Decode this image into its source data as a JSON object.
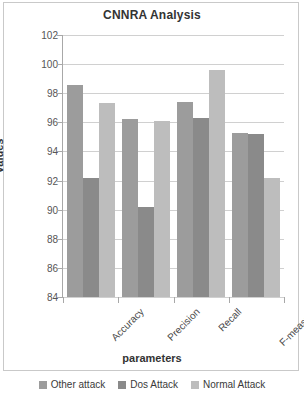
{
  "chart_data": {
    "type": "bar",
    "title": "CNNRA Analysis",
    "xlabel": "parameters",
    "ylabel": "Values",
    "categories": [
      "Accuracy",
      "Precision",
      "Recall",
      "F-measure"
    ],
    "series": [
      {
        "name": "Other attack",
        "color": "#9c9c9c",
        "values": [
          98.6,
          96.2,
          97.4,
          95.3
        ]
      },
      {
        "name": "Dos Attack",
        "color": "#8a8a8a",
        "values": [
          92.2,
          90.2,
          96.3,
          95.2
        ]
      },
      {
        "name": "Normal Attack",
        "color": "#bdbdbd",
        "values": [
          97.3,
          96.1,
          99.6,
          92.2
        ]
      }
    ],
    "ylim": [
      84,
      102
    ],
    "ytick_step": 2,
    "yticks": [
      102,
      100,
      98,
      96,
      94,
      92,
      90,
      88,
      86,
      84
    ],
    "grid": true,
    "legend_position": "bottom"
  }
}
